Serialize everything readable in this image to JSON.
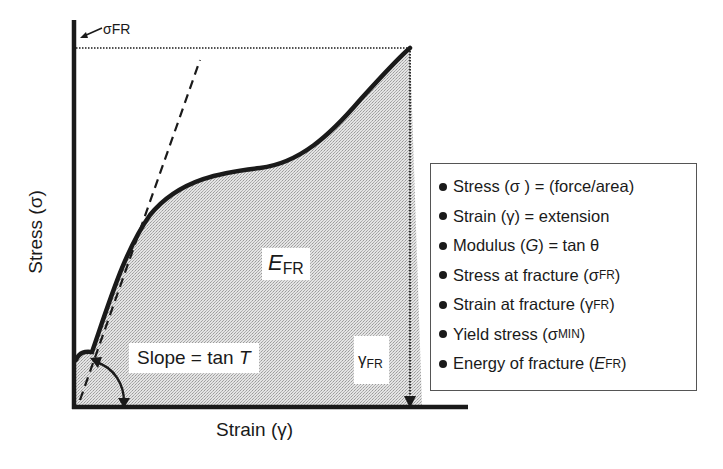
{
  "diagram": {
    "type": "stress-strain curve",
    "y_axis_label": "Stress (σ)",
    "x_axis_label": "Strain (γ)",
    "sigma_fr_marker": "σFR",
    "area_label": {
      "main": "E",
      "sub": "FR"
    },
    "slope_label": {
      "text": "Slope = tan ",
      "italic": "T"
    },
    "gamma_fr_label": {
      "main": "γ",
      "sub": "FR"
    },
    "colors": {
      "ink": "#1a1a1a",
      "shade": "#d6d6d6",
      "background": "#ffffff"
    }
  },
  "legend": {
    "items": [
      {
        "pre": "Stress (σ ) = (force/area)",
        "italic": "",
        "post": "",
        "sub": "",
        "close": ""
      },
      {
        "pre": "Strain (γ) = extension",
        "italic": "",
        "post": "",
        "sub": "",
        "close": ""
      },
      {
        "pre": "Modulus (",
        "italic": "G",
        "post": ") = tan θ",
        "sub": "",
        "close": ""
      },
      {
        "pre": "Stress at fracture (σ",
        "italic": "",
        "post": "",
        "sub": "FR",
        "close": ")"
      },
      {
        "pre": "Strain at fracture (γ",
        "italic": "",
        "post": "",
        "sub": "FR",
        "close": ")"
      },
      {
        "pre": "Yield stress (σ",
        "italic": "",
        "post": "",
        "sub": "MIN",
        "close": ")"
      },
      {
        "pre": "Energy of fracture (",
        "italic": "E",
        "post": "",
        "sub": "FR",
        "close": ")"
      }
    ]
  }
}
